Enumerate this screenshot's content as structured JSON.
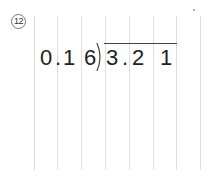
{
  "problem": {
    "number": "12",
    "divisor": [
      "0",
      ".",
      "1",
      "6"
    ],
    "dividend": [
      "3",
      ".",
      "2",
      "1"
    ]
  },
  "grid": {
    "line_positions": [
      34,
      57,
      81,
      105,
      129,
      153,
      176,
      200
    ],
    "line_color": "#dcdcdc"
  }
}
